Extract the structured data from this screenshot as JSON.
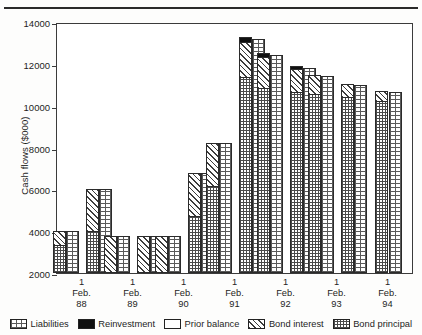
{
  "figure": {
    "background_color": "#ffffff",
    "ink_color": "#1d1d1d"
  },
  "axes": {
    "y_title": "Cash flows ($000)",
    "y_ticks": [
      2000,
      4000,
      6000,
      8000,
      10000,
      12000,
      14000
    ],
    "y_tick_labels": [
      "2000",
      "4000",
      "6000",
      "8000",
      "10000",
      "12000",
      "14000"
    ],
    "y_min": 2000,
    "y_max": 14000,
    "x_tick_labels": [
      {
        "day": "1",
        "month": "Feb.",
        "year": "88"
      },
      {
        "day": "1",
        "month": "Feb.",
        "year": "89"
      },
      {
        "day": "1",
        "month": "Feb.",
        "year": "90"
      },
      {
        "day": "1",
        "month": "Feb.",
        "year": "91"
      },
      {
        "day": "1",
        "month": "Feb.",
        "year": "92"
      },
      {
        "day": "1",
        "month": "Feb.",
        "year": "93"
      },
      {
        "day": "1",
        "month": "Feb.",
        "year": "94"
      }
    ]
  },
  "legend": {
    "position": "bottom",
    "items": [
      {
        "label": "Liabilities",
        "pattern": "dotted-grid",
        "swatch_name": "swatch-liabilities"
      },
      {
        "label": "Reinvestment",
        "pattern": "solid-black",
        "swatch_name": "swatch-reinvestment"
      },
      {
        "label": "Prior balance",
        "pattern": "white",
        "swatch_name": "swatch-prior-balance"
      },
      {
        "label": "Bond interest",
        "pattern": "diagonal-hatch",
        "swatch_name": "swatch-bond-interest"
      },
      {
        "label": "Bond principal",
        "pattern": "cross-grid",
        "swatch_name": "swatch-bond-principal"
      }
    ]
  },
  "chart_data": {
    "type": "bar",
    "subtype": "grouped-stacked",
    "title": "",
    "xlabel": "",
    "ylabel": "Cash flows ($000)",
    "ylim": [
      2000,
      14000
    ],
    "grid": false,
    "legend_position": "bottom",
    "categories": [
      "1 Feb. 88",
      "1 Feb. 89",
      "1 Feb. 90",
      "1 Feb. 91",
      "1 Feb. 92",
      "1 Feb. 93",
      "1 Feb. 94"
    ],
    "note": "Each date has two half-year bars. Left bar of each pair is the stacked asset cash-flow (Bond principal + Bond interest + Reinvestment); right bar is Liabilities.",
    "bars": [
      {
        "category": "1 Feb. 88",
        "period": "1",
        "side": "left",
        "kind": "assets",
        "total": 4000,
        "bond_principal": 2450,
        "bond_interest": 1550,
        "reinvestment": 0,
        "prior_balance": 0
      },
      {
        "category": "1 Feb. 88",
        "period": "1",
        "side": "right",
        "kind": "liabilities",
        "total": 4000,
        "liabilities": 4000
      },
      {
        "category": "1 Feb. 88",
        "period": "2",
        "side": "left",
        "kind": "assets",
        "total": 6000,
        "bond_principal": 2900,
        "bond_interest": 3100,
        "reinvestment": 0,
        "prior_balance": 0
      },
      {
        "category": "1 Feb. 88",
        "period": "2",
        "side": "right",
        "kind": "liabilities",
        "total": 6000,
        "liabilities": 6000
      },
      {
        "category": "1 Feb. 89",
        "period": "1",
        "side": "left",
        "kind": "assets",
        "total": 3750,
        "bond_principal": 0,
        "bond_interest": 3750,
        "reinvestment": 0,
        "prior_balance": 0
      },
      {
        "category": "1 Feb. 89",
        "period": "1",
        "side": "right",
        "kind": "liabilities",
        "total": 3750,
        "liabilities": 3750
      },
      {
        "category": "1 Feb. 89",
        "period": "2",
        "side": "left",
        "kind": "assets",
        "total": 3750,
        "bond_principal": 0,
        "bond_interest": 3750,
        "reinvestment": 0,
        "prior_balance": 0
      },
      {
        "category": "1 Feb. 89",
        "period": "2",
        "side": "right",
        "kind": "liabilities",
        "total": 3750,
        "liabilities": 3750
      },
      {
        "category": "1 Feb. 90",
        "period": "1",
        "side": "left",
        "kind": "assets",
        "total": 3750,
        "bond_principal": 0,
        "bond_interest": 3750,
        "reinvestment": 0,
        "prior_balance": 0
      },
      {
        "category": "1 Feb. 90",
        "period": "1",
        "side": "right",
        "kind": "liabilities",
        "total": 3750,
        "liabilities": 3750
      },
      {
        "category": "1 Feb. 90",
        "period": "2",
        "side": "left",
        "kind": "assets",
        "total": 6800,
        "bond_principal": 3750,
        "bond_interest": 3050,
        "reinvestment": 0,
        "prior_balance": 0
      },
      {
        "category": "1 Feb. 90",
        "period": "2",
        "side": "right",
        "kind": "liabilities",
        "total": 6800,
        "liabilities": 6800
      },
      {
        "category": "1 Feb. 91",
        "period": "1",
        "side": "left",
        "kind": "assets",
        "total": 8200,
        "bond_principal": 5400,
        "bond_interest": 2800,
        "reinvestment": 0,
        "prior_balance": 0
      },
      {
        "category": "1 Feb. 91",
        "period": "1",
        "side": "right",
        "kind": "liabilities",
        "total": 8200,
        "liabilities": 8200
      },
      {
        "category": "1 Feb. 91",
        "period": "2",
        "side": "left",
        "kind": "assets",
        "total": 13300,
        "bond_principal": 10900,
        "bond_interest": 2000,
        "reinvestment": 400,
        "prior_balance": 0
      },
      {
        "category": "1 Feb. 91",
        "period": "2",
        "side": "right",
        "kind": "liabilities",
        "total": 13200,
        "liabilities": 13200
      },
      {
        "category": "1 Feb. 92",
        "period": "1",
        "side": "left",
        "kind": "assets",
        "total": 12500,
        "bond_principal": 10400,
        "bond_interest": 1800,
        "reinvestment": 300,
        "prior_balance": 0
      },
      {
        "category": "1 Feb. 92",
        "period": "1",
        "side": "right",
        "kind": "liabilities",
        "total": 12400,
        "liabilities": 12400
      },
      {
        "category": "1 Feb. 92",
        "period": "2",
        "side": "left",
        "kind": "assets",
        "total": 11900,
        "bond_principal": 10300,
        "bond_interest": 1300,
        "reinvestment": 300,
        "prior_balance": 0
      },
      {
        "category": "1 Feb. 92",
        "period": "2",
        "side": "right",
        "kind": "liabilities",
        "total": 11800,
        "liabilities": 11800
      },
      {
        "category": "1 Feb. 93",
        "period": "1",
        "side": "left",
        "kind": "assets",
        "total": 11450,
        "bond_principal": 10250,
        "bond_interest": 1200,
        "reinvestment": 0,
        "prior_balance": 0
      },
      {
        "category": "1 Feb. 93",
        "period": "1",
        "side": "right",
        "kind": "liabilities",
        "total": 11400,
        "liabilities": 11400
      },
      {
        "category": "1 Feb. 93",
        "period": "2",
        "side": "left",
        "kind": "assets",
        "total": 11050,
        "bond_principal": 10150,
        "bond_interest": 900,
        "reinvestment": 0,
        "prior_balance": 0
      },
      {
        "category": "1 Feb. 93",
        "period": "2",
        "side": "right",
        "kind": "liabilities",
        "total": 11000,
        "liabilities": 11000
      },
      {
        "category": "1 Feb. 94",
        "period": "1",
        "side": "left",
        "kind": "assets",
        "total": 10700,
        "bond_principal": 10000,
        "bond_interest": 700,
        "reinvestment": 0,
        "prior_balance": 0
      },
      {
        "category": "1 Feb. 94",
        "period": "1",
        "side": "right",
        "kind": "liabilities",
        "total": 10650,
        "liabilities": 10650
      }
    ]
  }
}
